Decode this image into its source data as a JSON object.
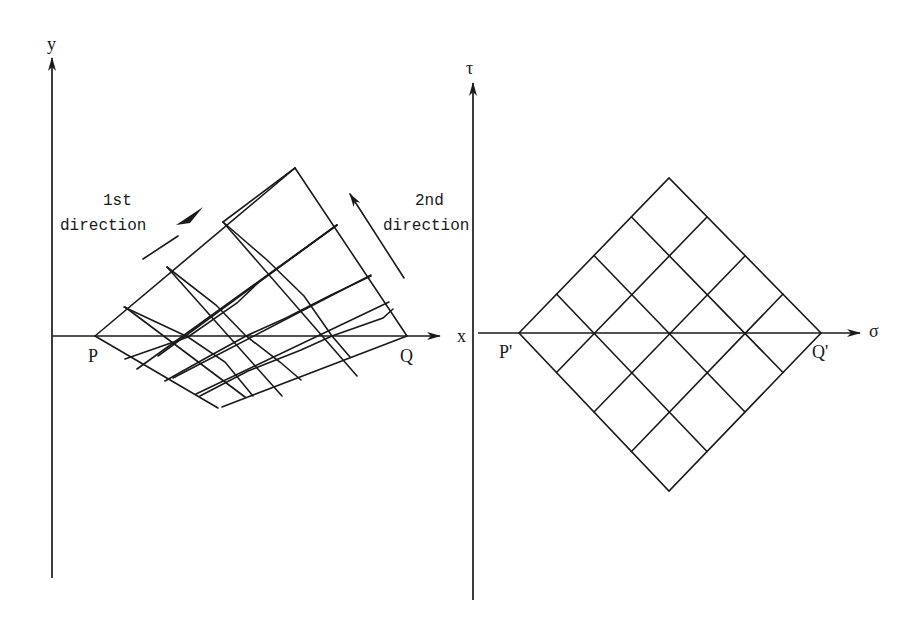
{
  "figure": {
    "left_panel": {
      "axes": {
        "vertical_label": "y",
        "horizontal_label": "x"
      },
      "points": {
        "start": "P",
        "end": "Q"
      },
      "annotations": {
        "first_direction": {
          "line1": "1st",
          "line2": "direction"
        },
        "second_direction": {
          "line1": "2nd",
          "line2": "direction"
        }
      }
    },
    "right_panel": {
      "axes": {
        "vertical_label": "τ",
        "horizontal_label": "σ"
      },
      "points": {
        "start": "P'",
        "end": "Q'"
      },
      "grid": {
        "type": "diamond",
        "divisions_per_side": 4
      }
    }
  },
  "colors": {
    "ink": "#1a1a1a",
    "background": "#ffffff"
  }
}
